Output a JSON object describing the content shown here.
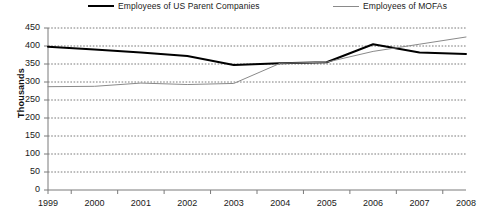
{
  "chart_data": {
    "type": "line",
    "title": "",
    "subtitle": "",
    "xlabel": "",
    "ylabel": "Thousands",
    "x": [
      1999,
      2000,
      2001,
      2002,
      2003,
      2004,
      2005,
      2006,
      2007,
      2008
    ],
    "categories": [
      "1999",
      "2000",
      "2001",
      "2002",
      "2003",
      "2004",
      "2005",
      "2006",
      "2007",
      "2008"
    ],
    "series": [
      {
        "name": "Employees of US Parent Companies",
        "color": "#000000",
        "width": 2,
        "values": [
          398,
          390,
          382,
          372,
          347,
          352,
          355,
          405,
          382,
          378
        ]
      },
      {
        "name": "Employees of MOFAs",
        "color": "#8a8a8a",
        "width": 1,
        "values": [
          287,
          288,
          297,
          293,
          296,
          352,
          355,
          385,
          405,
          425
        ]
      }
    ],
    "ylim": [
      0,
      450
    ],
    "yticks": [
      0,
      50,
      100,
      150,
      200,
      250,
      300,
      350,
      400,
      450
    ],
    "ytick_labels": [
      "0",
      "50",
      "100",
      "150",
      "200",
      "250",
      "300",
      "350",
      "400",
      "450"
    ],
    "xlim": [
      1999,
      2008
    ],
    "grid": true,
    "grid_style": "dotted-horizontal",
    "grid_color": "#7a7a7a",
    "legend_position": "top",
    "axis_color": "#7a7a7a"
  },
  "legend": {
    "entries": [
      {
        "label": "Employees of US Parent Companies"
      },
      {
        "label": "Employees of MOFAs"
      }
    ]
  },
  "axes": {
    "y_title": "Thousands"
  }
}
